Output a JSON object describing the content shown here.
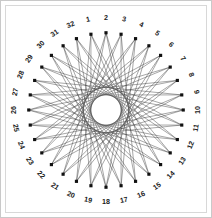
{
  "figure": {
    "title": "",
    "frame_border_color": "#c9c9c9",
    "background_color": "#ffffff",
    "line_color": "#3b3b3b",
    "vertex_color": "#111111",
    "label_color": "#1a1a1a"
  },
  "chart_data": {
    "type": "scatter",
    "title": "",
    "subtitle": "",
    "xlabel": "",
    "ylabel": "",
    "grid": false,
    "legend": "none",
    "n_points": 32,
    "step": 13,
    "circle_radius": 78,
    "center_x": 101,
    "center_y": 105,
    "label_radius": 93,
    "start_angle_deg": -101.25,
    "angle_step_deg": 11.25,
    "categories": [
      "1",
      "2",
      "3",
      "4",
      "5",
      "6",
      "7",
      "8",
      "9",
      "10",
      "11",
      "12",
      "13",
      "14",
      "15",
      "16",
      "17",
      "18",
      "19",
      "20",
      "21",
      "22",
      "23",
      "24",
      "25",
      "26",
      "27",
      "28",
      "29",
      "30",
      "31",
      "32"
    ],
    "values": [
      1,
      2,
      3,
      4,
      5,
      6,
      7,
      8,
      9,
      10,
      11,
      12,
      13,
      14,
      15,
      16,
      17,
      18,
      19,
      20,
      21,
      22,
      23,
      24,
      25,
      26,
      27,
      28,
      29,
      30,
      31,
      32
    ],
    "xlim": [
      -1,
      1
    ],
    "ylim": [
      -1,
      1
    ]
  },
  "labels": [
    {
      "n": "1",
      "index": 1
    },
    {
      "n": "2",
      "index": 2
    },
    {
      "n": "3",
      "index": 3
    },
    {
      "n": "4",
      "index": 4
    },
    {
      "n": "5",
      "index": 5
    },
    {
      "n": "6",
      "index": 6
    },
    {
      "n": "7",
      "index": 7
    },
    {
      "n": "8",
      "index": 8
    },
    {
      "n": "9",
      "index": 9
    },
    {
      "n": "10",
      "index": 10
    },
    {
      "n": "11",
      "index": 11
    },
    {
      "n": "12",
      "index": 12
    },
    {
      "n": "13",
      "index": 13
    },
    {
      "n": "14",
      "index": 14
    },
    {
      "n": "15",
      "index": 15
    },
    {
      "n": "16",
      "index": 16
    },
    {
      "n": "17",
      "index": 17
    },
    {
      "n": "18",
      "index": 18
    },
    {
      "n": "19",
      "index": 19
    },
    {
      "n": "20",
      "index": 20
    },
    {
      "n": "21",
      "index": 21
    },
    {
      "n": "22",
      "index": 22
    },
    {
      "n": "23",
      "index": 23
    },
    {
      "n": "24",
      "index": 24
    },
    {
      "n": "25",
      "index": 25
    },
    {
      "n": "26",
      "index": 26
    },
    {
      "n": "27",
      "index": 27
    },
    {
      "n": "28",
      "index": 28
    },
    {
      "n": "29",
      "index": 29
    },
    {
      "n": "30",
      "index": 30
    },
    {
      "n": "31",
      "index": 31
    },
    {
      "n": "32",
      "index": 32
    }
  ]
}
